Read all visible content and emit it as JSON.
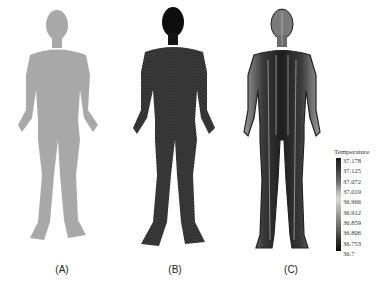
{
  "figure": {
    "panels": [
      {
        "label": "(A)",
        "description": "solid gray human body model, front view",
        "fill": "#a8a8a8"
      },
      {
        "label": "(B)",
        "description": "meshed human body model, front view",
        "fill": "#1c1c1c"
      },
      {
        "label": "(C)",
        "description": "temperature distribution, back view",
        "fill": "#4a4a4a"
      }
    ],
    "legend": {
      "title": "Temperature",
      "ticks": [
        "37.178",
        "37.125",
        "37.072",
        "37.019",
        "36.966",
        "36.912",
        "36.859",
        "36.806",
        "36.753",
        "36.7"
      ]
    }
  }
}
